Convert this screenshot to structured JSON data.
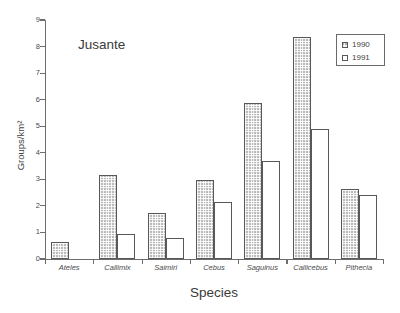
{
  "chart_data": {
    "type": "bar",
    "title": "Jusante",
    "xlabel": "Species",
    "ylabel": "Groups/km²",
    "ylim": [
      0,
      9
    ],
    "ytick_labels": [
      "0",
      "1",
      "2",
      "3",
      "4",
      "5",
      "6",
      "7",
      "8",
      "9"
    ],
    "yticks": [
      0,
      1,
      2,
      3,
      4,
      5,
      6,
      7,
      8,
      9
    ],
    "grid": false,
    "legend_position": "top-right",
    "categories": [
      "Ateles",
      "Callimix",
      "Saimiri",
      "Cebus",
      "Saguinus",
      "Callicebus",
      "Pithecia"
    ],
    "series": [
      {
        "name": "1990",
        "fill": "hatched-gray",
        "color": "#b9b9b9",
        "values": [
          0.65,
          3.15,
          1.72,
          2.97,
          5.88,
          8.35,
          2.65
        ]
      },
      {
        "name": "1991",
        "fill": "white",
        "color": "#ffffff",
        "values": [
          null,
          0.93,
          0.78,
          2.16,
          3.7,
          4.88,
          2.42
        ]
      }
    ]
  },
  "legend": {
    "entries": [
      {
        "label": "1990",
        "swatch": "hatched-gray-swatch"
      },
      {
        "label": "1991",
        "swatch": "white-swatch"
      }
    ]
  },
  "colors": {
    "axis": "#6d6d6d",
    "bar_outline": "#585858",
    "series_1990": "#b9b9b9",
    "series_1991": "#ffffff",
    "text": "#3a3a3a",
    "background": "#ffffff"
  }
}
